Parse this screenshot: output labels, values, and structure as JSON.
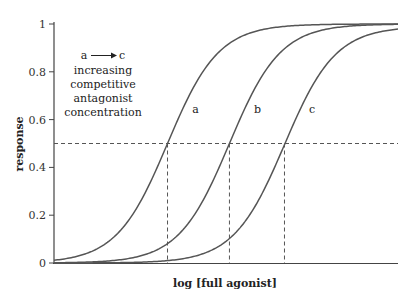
{
  "chart_data": {
    "type": "line",
    "title": "",
    "xlabel": "log [full agonist]",
    "ylabel": "response",
    "ylim": [
      0,
      1
    ],
    "yticks": [
      0,
      0.2,
      0.4,
      0.6,
      0.8,
      1
    ],
    "ytick_labels": [
      "0",
      "0.2",
      "0.4",
      "0.6",
      "0.8",
      "1"
    ],
    "xticks": [],
    "grid": false,
    "legend": "none",
    "series": [
      {
        "name": "a",
        "ec50_x_fraction": 0.33,
        "hill": 1,
        "max": 1.0
      },
      {
        "name": "b",
        "ec50_x_fraction": 0.51,
        "hill": 1,
        "max": 1.0
      },
      {
        "name": "c",
        "ec50_x_fraction": 0.67,
        "hill": 1,
        "max": 0.99
      }
    ],
    "reference_lines": {
      "horizontal": {
        "y": 0.5,
        "style": "dashed"
      },
      "vertical": [
        {
          "series": "a",
          "x_fraction": 0.33,
          "style": "dashed"
        },
        {
          "series": "b",
          "x_fraction": 0.51,
          "style": "dashed"
        },
        {
          "series": "c",
          "x_fraction": 0.67,
          "style": "dashed"
        }
      ]
    },
    "annotations": [
      {
        "text": "a → c",
        "lines": [
          "increasing",
          "competitive",
          "antagonist",
          "concentration"
        ]
      }
    ]
  },
  "labels": {
    "annotation_arrow_from": "a",
    "annotation_arrow_to": "c",
    "annotation_lines": [
      "increasing",
      "competitive",
      "antagonist",
      "concentration"
    ]
  }
}
